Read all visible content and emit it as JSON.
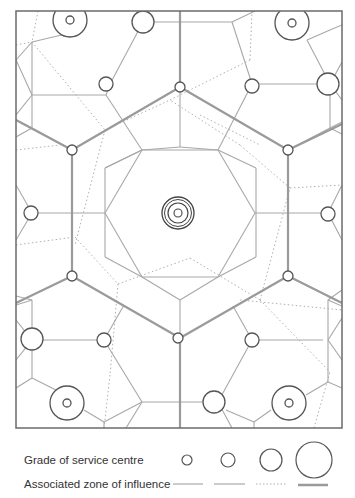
{
  "diagram": {
    "colors": {
      "frame": "#6b6b6b",
      "line": "#a8a8a8",
      "circle": "#555555",
      "heavy_line": "#9a9a9a"
    }
  },
  "legend": {
    "grade_label": "Grade of service centre",
    "zone_label": "Associated zone of influence",
    "grades": [
      {
        "grade": 1,
        "radius": 5,
        "line_style": "thin-solid"
      },
      {
        "grade": 2,
        "radius": 7,
        "line_style": "thin-solid"
      },
      {
        "grade": 3,
        "radius": 11,
        "line_style": "dotted"
      },
      {
        "grade": 4,
        "radius": 18,
        "line_style": "thick-solid"
      }
    ]
  }
}
